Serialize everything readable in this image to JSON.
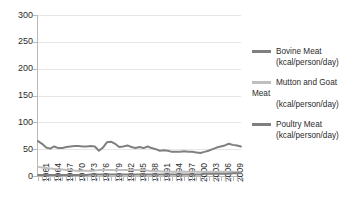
{
  "chart_data": {
    "type": "line",
    "title": "",
    "xlabel": "",
    "ylabel": "",
    "ylim": [
      0,
      300
    ],
    "ytick_step": 50,
    "yticks": [
      "0",
      "50",
      "100",
      "150",
      "200",
      "250",
      "300"
    ],
    "grid": true,
    "legend_position": "right",
    "xtick_labels": [
      "1961",
      "1964",
      "1967",
      "1970",
      "1973",
      "1976",
      "1979",
      "1982",
      "1985",
      "1988",
      "1991",
      "1994",
      "1997",
      "2000",
      "2003",
      "2006",
      "2009"
    ],
    "x_start": 1961,
    "x_end": 2011,
    "x": [
      1961,
      1962,
      1963,
      1964,
      1965,
      1966,
      1967,
      1968,
      1969,
      1970,
      1971,
      1972,
      1973,
      1974,
      1975,
      1976,
      1977,
      1978,
      1979,
      1980,
      1981,
      1982,
      1983,
      1984,
      1985,
      1986,
      1987,
      1988,
      1989,
      1990,
      1991,
      1992,
      1993,
      1994,
      1995,
      1996,
      1997,
      1998,
      1999,
      2000,
      2001,
      2002,
      2003,
      2004,
      2005,
      2006,
      2007,
      2008,
      2009,
      2010,
      2011
    ],
    "series": [
      {
        "name": "Bovine Meat (kcal/person/day)",
        "color": "#808080",
        "values": [
          65,
          60,
          53,
          51,
          55,
          52,
          52,
          54,
          55,
          56,
          56,
          55,
          55,
          56,
          55,
          47,
          53,
          63,
          64,
          60,
          54,
          55,
          57,
          54,
          52,
          54,
          52,
          55,
          52,
          50,
          47,
          48,
          47,
          45,
          45,
          45,
          46,
          45,
          45,
          44,
          43,
          45,
          47,
          50,
          53,
          55,
          57,
          60,
          58,
          57,
          55
        ]
      },
      {
        "name": "Mutton and Goat Meat (kcal/person/day)",
        "color": "#bfbfbf",
        "values": [
          17,
          16,
          15,
          14,
          13,
          12,
          12,
          11,
          11,
          10,
          10,
          10,
          10,
          10,
          10,
          11,
          11,
          11,
          11,
          11,
          11,
          11,
          11,
          11,
          11,
          11,
          11,
          10,
          9,
          9,
          9,
          8,
          8,
          8,
          8,
          8,
          8,
          8,
          8,
          8,
          8,
          8,
          8,
          8,
          8,
          8,
          8,
          8,
          8,
          7,
          7
        ]
      },
      {
        "name": "Poultry Meat (kcal/person/day)",
        "color": "#7f7f7f",
        "values": [
          2,
          2,
          2,
          2,
          2,
          2,
          2,
          2,
          2,
          2,
          2,
          2,
          2,
          3,
          3,
          3,
          3,
          3,
          3,
          3,
          3,
          3,
          3,
          3,
          3,
          3,
          3,
          3,
          3,
          3,
          3,
          3,
          3,
          3,
          3,
          3,
          3,
          3,
          3,
          3,
          3,
          4,
          4,
          4,
          4,
          4,
          4,
          4,
          5,
          5,
          5
        ]
      }
    ]
  },
  "legend": {
    "entries": [
      {
        "line1": "Bovine Meat",
        "line2": "(kcal/person/day)",
        "line3": ""
      },
      {
        "line1": "Mutton and Goat",
        "line2": "Meat",
        "line3": "(kcal/person/day)"
      },
      {
        "line1": "Poultry Meat",
        "line2": "(kcal/person/day)",
        "line3": ""
      }
    ]
  }
}
